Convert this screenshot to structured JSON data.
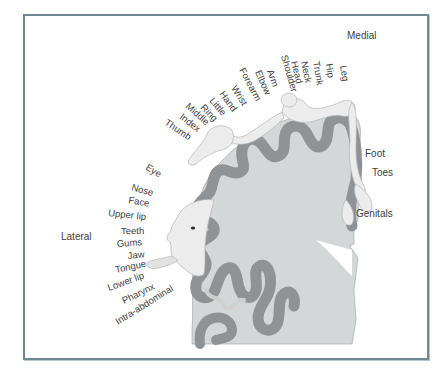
{
  "diagram": {
    "orientation": {
      "medial": "Medial",
      "lateral": "Lateral"
    },
    "upper_arc_labels": [
      "Leg",
      "Hip",
      "Trunk",
      "Neck",
      "Head",
      "Shoulder",
      "Arm",
      "Elbow",
      "Forearm",
      "Wrist",
      "Hand",
      "Little",
      "Ring",
      "Middle",
      "Index",
      "Thumb"
    ],
    "face_labels": [
      "Eye",
      "Nose",
      "Face",
      "Upper lip",
      "Teeth",
      "Gums",
      "Jaw",
      "Tongue",
      "Lower lip",
      "Pharynx",
      "Intra-abdominal"
    ],
    "right_labels": [
      "Foot",
      "Toes",
      "Genitals"
    ],
    "colors": {
      "frame_border": "#6f8a94",
      "cortex_gray_matter": "#8f9396",
      "white_matter": "#d3d7d8",
      "figure_skin": "#e9e9e9",
      "label_text": "#3d3d3d"
    }
  }
}
